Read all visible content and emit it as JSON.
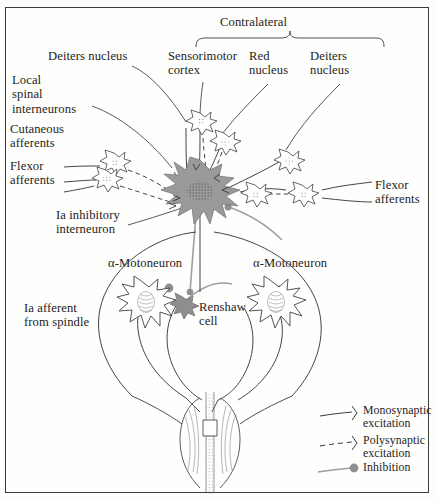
{
  "figure": {
    "background_color": "#fdfdfb",
    "frame_color": "#3b3b3b"
  },
  "colors": {
    "ink": "#1d1d1d",
    "stroke": "#3a3a3a",
    "interneuron_fill": "#9a9a9a",
    "renshaw_fill": "#8f8f8f",
    "synapse_ball": "#8f8f8f",
    "inhibition_line": "#9a9a9a",
    "cell_outline": "#4a4a4a",
    "cell_fill": "#ffffff"
  },
  "brace": {
    "label": "Contralateral"
  },
  "labels": {
    "deiters_nucleus_left": "Deiters nucleus",
    "local_spinal_interneurons": "Local\nspinal\ninterneurons",
    "cutaneous_afferents": "Cutaneous\nafferents",
    "flexor_afferents_left": "Flexor\nafferents",
    "ia_inhibitory_interneuron": "Ia inhibitory\ninterneuron",
    "sensorimotor_cortex": "Sensorimotor\ncortex",
    "red_nucleus": "Red\nnucleus",
    "deiters_nucleus_right": "Deiters\nnucleus",
    "flexor_afferents_right": "Flexor\nafferents",
    "alpha_motoneuron_left": "α-Motoneuron",
    "alpha_motoneuron_right": "α-Motoneuron",
    "renshaw_cell": "Renshaw\ncell",
    "ia_afferent_from_spindle": "Ia afferent\nfrom spindle"
  },
  "legend": {
    "items": [
      {
        "name": "monosynaptic",
        "label": "Monosynaptic\nexcitation",
        "style": "solid-line-with-terminal"
      },
      {
        "name": "polysynaptic",
        "label": "Polysynaptic\nexcitation",
        "style": "dashed-line-with-terminal"
      },
      {
        "name": "inhibition",
        "label": "Inhibition",
        "style": "line-with-filled-ball"
      }
    ]
  }
}
